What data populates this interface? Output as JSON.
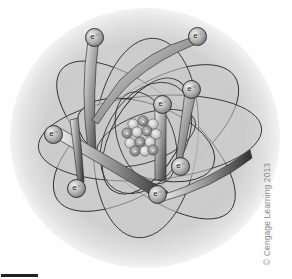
{
  "figure": {
    "credit": "© Cengage Learning 2013",
    "colors": {
      "background": "#ffffff",
      "orbit_fill": "#c9c9c9",
      "orbit_stroke": "#333333",
      "electron": "#9a9a9a",
      "proton": "#8c8c8c",
      "neutron": "#d0d0d0"
    }
  },
  "nucleus": {
    "label": "nucleus",
    "proton_symbol": "+"
  },
  "electrons": [
    {
      "label": "e⁻",
      "x": 93,
      "y": 36
    },
    {
      "label": "e⁻",
      "x": 196,
      "y": 35
    },
    {
      "label": "e⁻",
      "x": 190,
      "y": 88
    },
    {
      "label": "e⁻",
      "x": 161,
      "y": 103
    },
    {
      "label": "e⁻",
      "x": 52,
      "y": 133
    },
    {
      "label": "e⁻",
      "x": 75,
      "y": 187
    },
    {
      "label": "e⁻",
      "x": 179,
      "y": 165
    },
    {
      "label": "e⁻",
      "x": 156,
      "y": 193
    }
  ],
  "scale_bar": {
    "visible": true
  }
}
